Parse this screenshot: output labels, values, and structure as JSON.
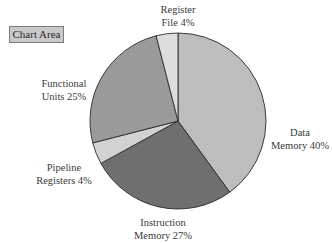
{
  "chart_area_label": "Chart Area",
  "chart_data": {
    "type": "pie",
    "title": "",
    "start": "12 o'clock, clockwise",
    "slices": [
      {
        "name": "Data Memory",
        "value": 40,
        "label_lines": [
          "Data",
          "Memory 40%"
        ],
        "color": "#bdbdbd"
      },
      {
        "name": "Instruction Memory",
        "value": 27,
        "label_lines": [
          "Instruction",
          "Memory 27%"
        ],
        "color": "#6f6f6f"
      },
      {
        "name": "Pipeline Registers",
        "value": 4,
        "label_lines": [
          "Pipeline",
          "Registers 4%"
        ],
        "color": "#d2d2d2"
      },
      {
        "name": "Functional Units",
        "value": 25,
        "label_lines": [
          "Functional",
          "Units 25%"
        ],
        "color": "#9a9a9a"
      },
      {
        "name": "Register File",
        "value": 4,
        "label_lines": [
          "Register",
          "File 4%"
        ],
        "color": "#dcdcdc"
      }
    ],
    "legend": "none"
  }
}
